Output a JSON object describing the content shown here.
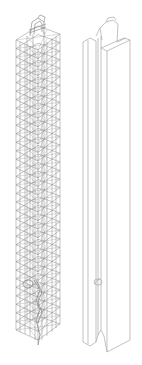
{
  "figure": {
    "panels": [
      {
        "id": "rebar-cage",
        "label": "Reinforcement cage (wireframe)"
      },
      {
        "id": "column-solid",
        "label": "Column outline (solid)"
      }
    ],
    "colors": {
      "background": "#ffffff",
      "rebar_line": "#8a8a8a",
      "rebar_dense": "#6e6e6e",
      "outline": "#a8a8a8"
    },
    "rebar": {
      "stirrup_count": 34,
      "top_y": 40,
      "bottom_y": 330
    }
  }
}
